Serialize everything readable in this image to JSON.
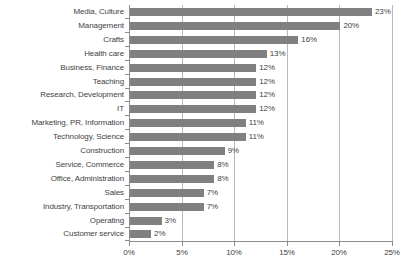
{
  "chart_data": {
    "type": "bar",
    "orientation": "horizontal",
    "title": "",
    "subtitle": "",
    "xlabel": "",
    "ylabel": "",
    "xlim": [
      0,
      25
    ],
    "xticks": [
      0,
      5,
      10,
      15,
      20,
      25
    ],
    "xtick_labels": [
      "0%",
      "5%",
      "10%",
      "15%",
      "20%",
      "25%"
    ],
    "grid": true,
    "grid_axis": "x",
    "legend": false,
    "legend_position": "none",
    "value_label_suffix": "%",
    "bar_color": "#808080",
    "gridline_color": "#b8b8b8",
    "axis_color": "#8c8c8c",
    "text_color": "#3f3f3f",
    "background": "#ffffff",
    "categories": [
      "Media, Culture",
      "Management",
      "Crafts",
      "Health care",
      "Business, Finance",
      "Teaching",
      "Research, Development",
      "IT",
      "Marketing, PR, Information",
      "Technology, Science",
      "Construction",
      "Service, Commerce",
      "Office, Administration",
      "Sales",
      "Industry, Transportation",
      "Operating",
      "Customer service"
    ],
    "values": [
      23,
      20,
      16,
      13,
      12,
      12,
      12,
      12,
      11,
      11,
      9,
      8,
      8,
      7,
      7,
      3,
      2
    ],
    "value_labels": [
      "23%",
      "20%",
      "16%",
      "13%",
      "12%",
      "12%",
      "12%",
      "12%",
      "11%",
      "11%",
      "9%",
      "8%",
      "8%",
      "7%",
      "7%",
      "3%",
      "2%"
    ]
  }
}
